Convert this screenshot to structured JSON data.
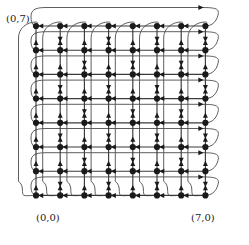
{
  "figure": {
    "width": 249,
    "height": 245,
    "background": "#ffffff"
  },
  "labels": {
    "top_left": "(0,7)",
    "bottom_left": "(0,0)",
    "bottom_right": "(7,0)"
  },
  "graph": {
    "type": "torus-grid",
    "columns": 8,
    "rows": 8,
    "node_count": 64,
    "edge_direction_horizontal": "right-to-left",
    "edge_direction_vertical": "bottom-to-top",
    "wraparound": true,
    "node_color": "#1a1a1a",
    "edge_color": "#3a3a3a",
    "wrap_edge_color": "#555555",
    "node_radius": 3.1,
    "origin_x": 36,
    "origin_y": 195,
    "spacing_x": 24.2,
    "spacing_y": 24.2,
    "x_coords": [
      36,
      60.2,
      84.4,
      108.6,
      132.8,
      157,
      181.2,
      205.4
    ],
    "y_coords": [
      26,
      50.2,
      74.4,
      98.6,
      122.8,
      147,
      171.2,
      195.4
    ]
  }
}
